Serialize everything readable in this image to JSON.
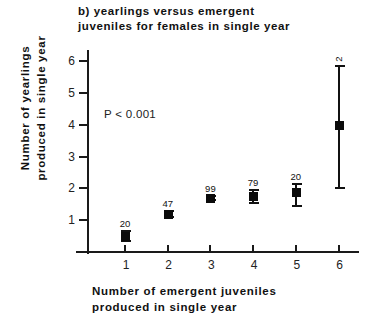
{
  "chart_data": {
    "type": "scatter",
    "title": "b) yearlings  versus  emergent\n    juveniles  for  females  in  single  year",
    "xlabel_lines": [
      "Number  of  emergent  juveniles",
      "produced  in  single  year"
    ],
    "ylabel_lines": [
      "Number  of  yearlings",
      "produced  in  single  year"
    ],
    "annotation": "P < 0.001",
    "xlabel": "Number of emergent juveniles produced in single year",
    "ylabel": "Number of yearlings produced in single year",
    "x": [
      1,
      2,
      3,
      4,
      5,
      6
    ],
    "values": [
      0.5,
      1.2,
      1.7,
      1.75,
      1.9,
      4.0
    ],
    "err_low": [
      0.35,
      1.1,
      1.65,
      1.55,
      1.45,
      2.0
    ],
    "err_high": [
      0.65,
      1.3,
      1.75,
      1.95,
      2.15,
      5.85
    ],
    "sample_sizes": [
      20,
      47,
      99,
      79,
      20,
      2
    ],
    "xtick_labels": [
      "1",
      "2",
      "3",
      "4",
      "5",
      "6"
    ],
    "ytick_labels": [
      "1",
      "2",
      "3",
      "4",
      "5",
      "6"
    ],
    "xlim": [
      0.45,
      6.55
    ],
    "ylim": [
      0,
      6.3
    ],
    "grid": false,
    "legend": "none",
    "marker_color": "#0b0b0b",
    "axis_color": "#1a1a1a"
  }
}
